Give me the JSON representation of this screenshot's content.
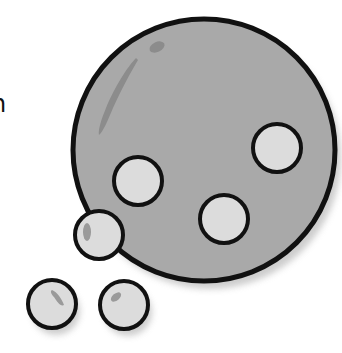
{
  "caption": {
    "partial_text": "n"
  },
  "illustration": {
    "subject": "gray sphere with circular holes and small bubbles",
    "colors": {
      "outline": "#111111",
      "body_fill": "#a9a9a9",
      "hole_fill": "#dcdcdc",
      "highlight": "#8c8c8c",
      "shadow": "#cfcfcf",
      "background": "#ffffff"
    },
    "main_sphere": {
      "cx": 204,
      "cy": 150,
      "r": 131
    },
    "holes": [
      {
        "cx": 277,
        "cy": 148,
        "r": 24
      },
      {
        "cx": 138,
        "cy": 181,
        "r": 24
      },
      {
        "cx": 224,
        "cy": 219,
        "r": 24
      }
    ],
    "bubbles": [
      {
        "cx": 99,
        "cy": 235,
        "r": 24
      },
      {
        "cx": 52,
        "cy": 304,
        "r": 24
      },
      {
        "cx": 124,
        "cy": 305,
        "r": 24
      }
    ]
  }
}
